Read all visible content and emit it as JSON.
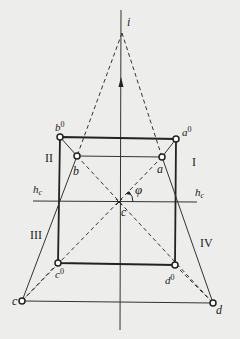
{
  "colors": {
    "background": "#ededeb",
    "line": "#222222"
  },
  "points": {
    "i": {
      "label": "i",
      "x": 122,
      "y": 33
    },
    "b0": {
      "label": "b",
      "sup": "0",
      "x": 60,
      "y": 137
    },
    "a0": {
      "label": "a",
      "sup": "0",
      "x": 176,
      "y": 139
    },
    "b": {
      "label": "b",
      "x": 77,
      "y": 156
    },
    "a": {
      "label": "a",
      "x": 162,
      "y": 157
    },
    "c_center": {
      "label": "c",
      "x": 119,
      "y": 202
    },
    "c0": {
      "label": "c",
      "sup": "0",
      "x": 58,
      "y": 263
    },
    "d0": {
      "label": "d",
      "sup": "0",
      "x": 175,
      "y": 265
    },
    "c": {
      "label": "c",
      "x": 22,
      "y": 301
    },
    "d": {
      "label": "d",
      "x": 213,
      "y": 303
    }
  },
  "labels": {
    "i": "i",
    "b0_base": "b",
    "b0_sup": "0",
    "a0_base": "a",
    "a0_sup": "0",
    "b": "b",
    "a": "a",
    "phi": "φ",
    "hc_left_base": "h",
    "hc_left_sub": "c",
    "hc_right_base": "h",
    "hc_right_sub": "c",
    "center": "c",
    "c0_base": "c",
    "c0_sup": "0",
    "d0_base": "d",
    "d0_sup": "0",
    "c": "c",
    "d": "d"
  },
  "regions": {
    "I": "I",
    "II": "II",
    "III": "III",
    "IV": "IV"
  }
}
